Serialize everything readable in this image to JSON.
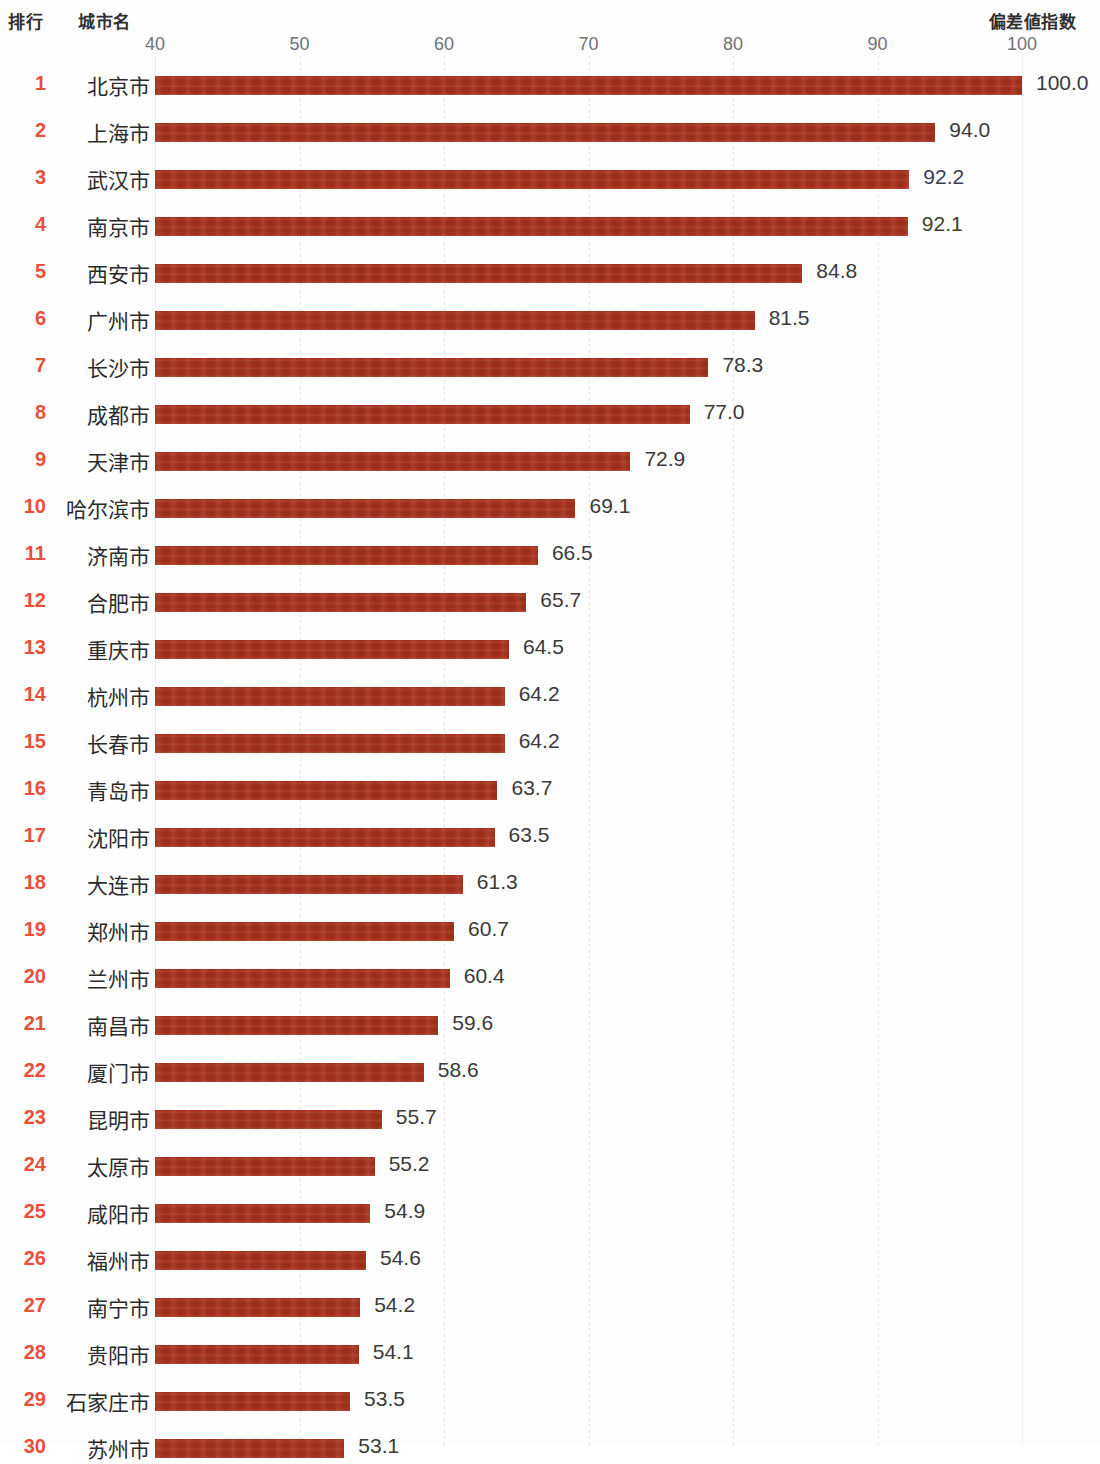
{
  "header": {
    "rank_label": "排行",
    "city_label": "城市名",
    "index_label": "偏差値指数"
  },
  "axis": {
    "ticks": [
      "40",
      "50",
      "60",
      "70",
      "80",
      "90",
      "100"
    ]
  },
  "colors": {
    "bar": "#a8311e",
    "rank_text": "#e8503a",
    "value_text": "#3a3a3a",
    "header_text": "#2f2f2f",
    "tick_text": "#6f7276",
    "gridline": "#e2e4e8",
    "background": "#fefefe"
  },
  "chart_data": {
    "type": "bar",
    "orientation": "horizontal",
    "title": "",
    "xlabel": "偏差値指数",
    "ylabel": "城市名",
    "xlim": [
      40,
      100
    ],
    "xticks": [
      40,
      50,
      60,
      70,
      80,
      90,
      100
    ],
    "grid": true,
    "legend": null,
    "categories": [
      "北京市",
      "上海市",
      "武汉市",
      "南京市",
      "西安市",
      "广州市",
      "长沙市",
      "成都市",
      "天津市",
      "哈尔滨市",
      "济南市",
      "合肥市",
      "重庆市",
      "杭州市",
      "长春市",
      "青岛市",
      "沈阳市",
      "大连市",
      "郑州市",
      "兰州市",
      "南昌市",
      "厦门市",
      "昆明市",
      "太原市",
      "咸阳市",
      "福州市",
      "南宁市",
      "贵阳市",
      "石家庄市",
      "苏州市"
    ],
    "values": [
      100.0,
      94.0,
      92.2,
      92.1,
      84.8,
      81.5,
      78.3,
      77.0,
      72.9,
      69.1,
      66.5,
      65.7,
      64.5,
      64.2,
      64.2,
      63.7,
      63.5,
      61.3,
      60.7,
      60.4,
      59.6,
      58.6,
      55.7,
      55.2,
      54.9,
      54.6,
      54.2,
      54.1,
      53.5,
      53.1
    ]
  },
  "rows": [
    {
      "rank": "1",
      "city": "北京市",
      "value": "100.0",
      "num": 100.0,
      "tint": ""
    },
    {
      "rank": "2",
      "city": "上海市",
      "value": "94.0",
      "num": 94.0,
      "tint": ""
    },
    {
      "rank": "3",
      "city": "武汉市",
      "value": "92.2",
      "num": 92.2,
      "tint": "tint-purple"
    },
    {
      "rank": "4",
      "city": "南京市",
      "value": "92.1",
      "num": 92.1,
      "tint": "tint-yellow"
    },
    {
      "rank": "5",
      "city": "西安市",
      "value": "84.8",
      "num": 84.8,
      "tint": ""
    },
    {
      "rank": "6",
      "city": "广州市",
      "value": "81.5",
      "num": 81.5,
      "tint": ""
    },
    {
      "rank": "7",
      "city": "长沙市",
      "value": "78.3",
      "num": 78.3,
      "tint": ""
    },
    {
      "rank": "8",
      "city": "成都市",
      "value": "77.0",
      "num": 77.0,
      "tint": ""
    },
    {
      "rank": "9",
      "city": "天津市",
      "value": "72.9",
      "num": 72.9,
      "tint": ""
    },
    {
      "rank": "10",
      "city": "哈尔滨市",
      "value": "69.1",
      "num": 69.1,
      "tint": ""
    },
    {
      "rank": "11",
      "city": "济南市",
      "value": "66.5",
      "num": 66.5,
      "tint": ""
    },
    {
      "rank": "12",
      "city": "合肥市",
      "value": "65.7",
      "num": 65.7,
      "tint": ""
    },
    {
      "rank": "13",
      "city": "重庆市",
      "value": "64.5",
      "num": 64.5,
      "tint": ""
    },
    {
      "rank": "14",
      "city": "杭州市",
      "value": "64.2",
      "num": 64.2,
      "tint": ""
    },
    {
      "rank": "15",
      "city": "长春市",
      "value": "64.2",
      "num": 64.2,
      "tint": ""
    },
    {
      "rank": "16",
      "city": "青岛市",
      "value": "63.7",
      "num": 63.7,
      "tint": ""
    },
    {
      "rank": "17",
      "city": "沈阳市",
      "value": "63.5",
      "num": 63.5,
      "tint": ""
    },
    {
      "rank": "18",
      "city": "大连市",
      "value": "61.3",
      "num": 61.3,
      "tint": ""
    },
    {
      "rank": "19",
      "city": "郑州市",
      "value": "60.7",
      "num": 60.7,
      "tint": ""
    },
    {
      "rank": "20",
      "city": "兰州市",
      "value": "60.4",
      "num": 60.4,
      "tint": ""
    },
    {
      "rank": "21",
      "city": "南昌市",
      "value": "59.6",
      "num": 59.6,
      "tint": ""
    },
    {
      "rank": "22",
      "city": "厦门市",
      "value": "58.6",
      "num": 58.6,
      "tint": ""
    },
    {
      "rank": "23",
      "city": "昆明市",
      "value": "55.7",
      "num": 55.7,
      "tint": ""
    },
    {
      "rank": "24",
      "city": "太原市",
      "value": "55.2",
      "num": 55.2,
      "tint": ""
    },
    {
      "rank": "25",
      "city": "咸阳市",
      "value": "54.9",
      "num": 54.9,
      "tint": ""
    },
    {
      "rank": "26",
      "city": "福州市",
      "value": "54.6",
      "num": 54.6,
      "tint": ""
    },
    {
      "rank": "27",
      "city": "南宁市",
      "value": "54.2",
      "num": 54.2,
      "tint": ""
    },
    {
      "rank": "28",
      "city": "贵阳市",
      "value": "54.1",
      "num": 54.1,
      "tint": ""
    },
    {
      "rank": "29",
      "city": "石家庄市",
      "value": "53.5",
      "num": 53.5,
      "tint": ""
    },
    {
      "rank": "30",
      "city": "苏州市",
      "value": "53.1",
      "num": 53.1,
      "tint": ""
    }
  ]
}
